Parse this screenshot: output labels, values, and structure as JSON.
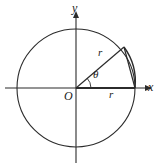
{
  "figure": {
    "name": "unit-circle-angle-diagram",
    "background_color": "#ffffff",
    "stroke_color": "#2b2b2b",
    "labels": {
      "axis_y": "y",
      "axis_x": "x",
      "origin": "O",
      "angle": "θ",
      "radius_hypotenuse": "r",
      "radius_base": "r"
    },
    "geometry": {
      "center_x": 76,
      "center_y": 88,
      "radius": 59,
      "angle_degrees": 43,
      "terminal_point_x": 124,
      "terminal_point_y": 47,
      "x_intercept_x": 135,
      "x_intercept_y": 88,
      "arc_marker_radius": 15
    },
    "axes": {
      "x_start_x": 5,
      "x_end_x": 147,
      "y_start_y": 12,
      "y_end_y": 163,
      "arrowhead": "triangle"
    }
  }
}
